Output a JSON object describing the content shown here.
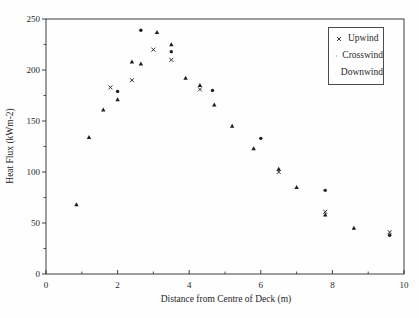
{
  "colors": {
    "ink": "#1f1f1f",
    "frame": "#2a2a2a",
    "background": "#ffffff"
  },
  "chart_data": {
    "type": "scatter",
    "title": "",
    "xlabel": "Distance from Centre of Deck (m)",
    "ylabel": "Heat Flux (kWm-2)",
    "xlim": [
      0,
      10
    ],
    "ylim": [
      0,
      250
    ],
    "x_major_ticks": [
      0,
      2,
      4,
      6,
      8,
      10
    ],
    "x_minor_ticks": [
      1,
      3,
      5,
      7,
      9
    ],
    "y_major_ticks": [
      0,
      50,
      100,
      150,
      200,
      250
    ],
    "y_minor_ticks": [
      25,
      75,
      125,
      175,
      225
    ],
    "grid": false,
    "legend_position": "top-right",
    "series": [
      {
        "name": "Upwind",
        "marker": "x",
        "color": "#1c1c1c",
        "points": [
          [
            1.8,
            183
          ],
          [
            2.4,
            190
          ],
          [
            3.0,
            220
          ],
          [
            3.5,
            210
          ],
          [
            4.3,
            181
          ],
          [
            6.5,
            100
          ],
          [
            7.8,
            61
          ],
          [
            9.6,
            41
          ]
        ]
      },
      {
        "name": "Crosswind",
        "marker": "circle",
        "color": "#1c1c1c",
        "points": [
          [
            2.0,
            179
          ],
          [
            2.65,
            239
          ],
          [
            3.5,
            218
          ],
          [
            4.65,
            180
          ],
          [
            6.0,
            133
          ],
          [
            7.8,
            82
          ],
          [
            9.6,
            38
          ]
        ]
      },
      {
        "name": "Downwind",
        "marker": "triangle",
        "color": "#1c1c1c",
        "points": [
          [
            0.85,
            68
          ],
          [
            1.2,
            134
          ],
          [
            1.6,
            161
          ],
          [
            2.0,
            171
          ],
          [
            2.4,
            208
          ],
          [
            2.65,
            206
          ],
          [
            3.1,
            237
          ],
          [
            3.5,
            225
          ],
          [
            3.9,
            192
          ],
          [
            4.3,
            185
          ],
          [
            4.7,
            166
          ],
          [
            5.2,
            145
          ],
          [
            5.8,
            123
          ],
          [
            6.5,
            103
          ],
          [
            7.0,
            85
          ],
          [
            7.8,
            58
          ],
          [
            8.6,
            45
          ]
        ]
      }
    ]
  }
}
